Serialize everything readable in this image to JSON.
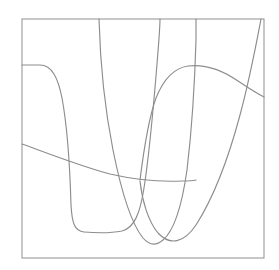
{
  "figure": {
    "type": "line-plot",
    "background_color": "#ffffff",
    "frame": {
      "name": "plot-frame",
      "color": "#9a9a9a",
      "stroke_width": 1.1,
      "x0": 22,
      "y0": 19,
      "x1": 264,
      "y1": 258
    },
    "axes": {
      "show_ticks": false,
      "show_tick_labels": false,
      "show_grid": false,
      "xlabel": "",
      "ylabel": "",
      "title": ""
    },
    "legend": {
      "visible": false,
      "position": "none",
      "entries": []
    }
  },
  "chart_data": {
    "type": "line",
    "title": "",
    "xlabel": "",
    "ylabel": "",
    "xlim": [
      22,
      264
    ],
    "ylim": [
      258,
      19
    ],
    "grid": false,
    "legend_position": "none",
    "stroke_color": "#8d8d8d",
    "series": [
      {
        "name": "curve-1",
        "description": "flat plateau at left, steep descent, flat trough at bottom, then steep rise exiting top edge",
        "path": "M 22 65 L 40 65 C 52 65 58 78 62 98 C 67 125 70 170 71 205 C 72 222 74 231 84 232 C 96 233 112 233 122 231 C 134 228 140 214 144 188 C 150 150 154 100 157 64 C 159 40 160 28 160 19",
        "points": [
          [
            22,
            65
          ],
          [
            40,
            65
          ],
          [
            52,
            72
          ],
          [
            62,
            98
          ],
          [
            67,
            130
          ],
          [
            71,
            205
          ],
          [
            78,
            231
          ],
          [
            100,
            233
          ],
          [
            122,
            231
          ],
          [
            138,
            215
          ],
          [
            148,
            165
          ],
          [
            156,
            80
          ],
          [
            160,
            19
          ]
        ]
      },
      {
        "name": "curve-2",
        "description": "steep descent from top edge to a U-shaped minimum then steep rise back to top edge",
        "path": "M 99 19 C 100 55 104 105 113 150 C 121 190 130 222 143 238 C 149 245 156 246 163 240 C 175 230 182 205 187 170 C 192 128 195 75 196 40 C 196 29 196 23 196 19",
        "points": [
          [
            99,
            19
          ],
          [
            104,
            80
          ],
          [
            113,
            150
          ],
          [
            130,
            222
          ],
          [
            152,
            245
          ],
          [
            172,
            222
          ],
          [
            187,
            170
          ],
          [
            193,
            100
          ],
          [
            196,
            19
          ]
        ]
      },
      {
        "name": "curve-3",
        "description": "broad dome peaking near the upper middle, steep left flank from the lower area, gentle right descent exiting the right edge",
        "path": "M 140 180 C 143 156 148 120 156 98 C 164 78 174 68 188 66 C 205 64 222 70 238 81 C 250 89 258 94 264 97",
        "points": [
          [
            140,
            180
          ],
          [
            148,
            128
          ],
          [
            160,
            92
          ],
          [
            178,
            69
          ],
          [
            196,
            66
          ],
          [
            218,
            73
          ],
          [
            240,
            83
          ],
          [
            264,
            97
          ]
        ]
      },
      {
        "name": "curve-4",
        "description": "gentle downward-sloping near-linear curve from the left edge flattening toward the middle-right",
        "path": "M 22 144 C 50 154 80 166 110 174 C 136 180 160 182 182 181 C 188 181 192 181 196 180",
        "points": [
          [
            22,
            144
          ],
          [
            60,
            158
          ],
          [
            110,
            174
          ],
          [
            150,
            181
          ],
          [
            182,
            181
          ],
          [
            196,
            180
          ]
        ]
      },
      {
        "name": "curve-5",
        "description": "steep rising curve from the lower-middle U bottom up through the right side, exiting the top edge near the right corner",
        "path": "M 140 181 C 142 200 148 221 158 233 C 170 246 184 243 196 225 C 212 200 228 160 240 115 C 250 78 257 40 261 19",
        "points": [
          [
            140,
            181
          ],
          [
            150,
            222
          ],
          [
            168,
            243
          ],
          [
            190,
            232
          ],
          [
            212,
            198
          ],
          [
            236,
            128
          ],
          [
            252,
            62
          ],
          [
            261,
            19
          ]
        ]
      }
    ]
  }
}
